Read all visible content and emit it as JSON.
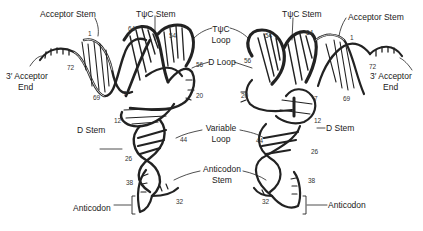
{
  "figure": {
    "panels": [
      "left",
      "right"
    ]
  },
  "labels": {
    "acceptor_stem": "Acceptor Stem",
    "tpsic_stem": "TψC Stem",
    "tpsic_loop_line1": "TψC",
    "tpsic_loop_line2": "Loop",
    "d_loop": "D Loop",
    "variable_loop_line1": "Variable",
    "variable_loop_line2": "Loop",
    "anticodon_stem_line1": "Anticodon",
    "anticodon_stem_line2": "Stem",
    "d_stem": "D Stem",
    "acceptor_end_line1": "3′ Acceptor",
    "acceptor_end_line2": "End",
    "anticodon": "Anticodon"
  },
  "residue_numbers": {
    "n1": "1",
    "n7": "7",
    "n12": "12",
    "n20": "20",
    "n26": "26",
    "n32": "32",
    "n38": "38",
    "n44": "44",
    "n54": "54",
    "n56": "56",
    "n64": "64",
    "n69": "69",
    "n72": "72"
  },
  "colors": {
    "ink": "#1a1a1a",
    "background": "#ffffff"
  }
}
